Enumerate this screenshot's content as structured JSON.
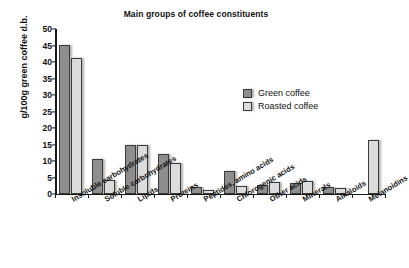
{
  "chart_data": {
    "type": "bar",
    "title": "Main groups of coffee constituents",
    "xlabel": "",
    "ylabel": "g/100g green coffee d.b.",
    "ylim": [
      0,
      50
    ],
    "yticks": [
      0,
      5,
      10,
      15,
      20,
      25,
      30,
      35,
      40,
      45,
      50
    ],
    "grid": false,
    "legend_position": "upper right",
    "categories": [
      "Insoluble carbohydrates",
      "Soluble carbohydrates",
      "Lipids",
      "Proteins",
      "Peptides, amino acids",
      "Chlorogenic acids",
      "Other acids",
      "Minerals",
      "Alkaloids",
      "Melanoidins"
    ],
    "series": [
      {
        "name": "Green coffee",
        "color": "#8e8e8e",
        "values": [
          45.2,
          10.5,
          14.9,
          12.0,
          2.0,
          6.9,
          2.6,
          3.4,
          2.1,
          0
        ]
      },
      {
        "name": "Roasted coffee",
        "color": "#dcdcdc",
        "values": [
          41.1,
          4.3,
          14.9,
          9.3,
          1.2,
          2.4,
          3.7,
          4.0,
          1.8,
          16.4
        ]
      }
    ]
  },
  "legend": {
    "items": [
      {
        "label": "Green coffee"
      },
      {
        "label": "Roasted coffee"
      }
    ]
  }
}
